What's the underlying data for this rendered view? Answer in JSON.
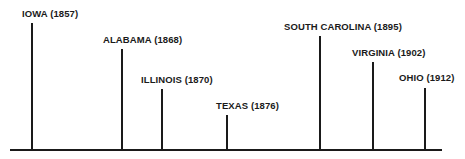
{
  "chart_data": {
    "type": "timeline",
    "title": "",
    "axis": {
      "baseline_y": 150,
      "x_start": 10,
      "x_end": 442
    },
    "events": [
      {
        "state": "IOWA",
        "year": "(1857)",
        "x": 32,
        "top": 23,
        "label_x": 22,
        "label_y": 8
      },
      {
        "state": "ALABAMA",
        "year": "(1868)",
        "x": 122,
        "top": 49,
        "label_x": 103,
        "label_y": 34
      },
      {
        "state": "ILLINOIS",
        "year": "(1870)",
        "x": 162,
        "top": 89,
        "label_x": 141,
        "label_y": 74
      },
      {
        "state": "TEXAS",
        "year": "(1876)",
        "x": 227,
        "top": 115,
        "label_x": 216,
        "label_y": 100
      },
      {
        "state": "SOUTH CAROLINA",
        "year": "(1895)",
        "x": 320,
        "top": 36,
        "label_x": 284,
        "label_y": 21
      },
      {
        "state": "VIRGINIA",
        "year": "(1902)",
        "x": 373,
        "top": 62,
        "label_x": 352,
        "label_y": 47
      },
      {
        "state": "OHIO",
        "year": "(1912)",
        "x": 425,
        "top": 88,
        "label_x": 399,
        "label_y": 72
      }
    ]
  }
}
